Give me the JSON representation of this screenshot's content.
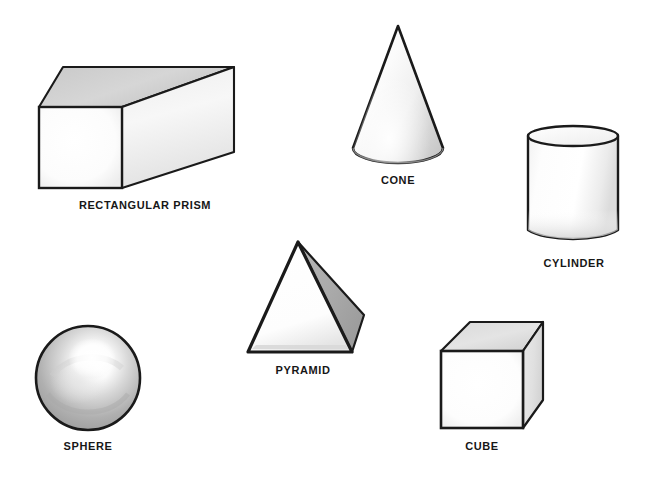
{
  "page": {
    "background_color": "#ffffff",
    "width": 653,
    "height": 479
  },
  "style": {
    "outline_color": "#1a1a1a",
    "fill_light": "#ffffff",
    "fill_shade_light": "#e8e8e8",
    "fill_shade_mid": "#c9c9c9",
    "fill_shade_dark": "#9a9a9a",
    "label_color": "#171717"
  },
  "shapes": [
    {
      "id": "rectangular-prism",
      "label": "RECTANGULAR PRISM",
      "label_x": 145,
      "label_y": 199,
      "faces": [
        "front-square",
        "top-face",
        "right-face"
      ]
    },
    {
      "id": "cone",
      "label": "CONE",
      "label_x": 398,
      "label_y": 174,
      "faces": [
        "lateral-surface",
        "base-ellipse"
      ]
    },
    {
      "id": "cylinder",
      "label": "CYLINDER",
      "label_x": 574,
      "label_y": 257,
      "faces": [
        "top-ellipse",
        "lateral-surface"
      ]
    },
    {
      "id": "pyramid",
      "label": "PYRAMID",
      "label_x": 303,
      "label_y": 364,
      "faces": [
        "front-triangle",
        "right-triangle"
      ]
    },
    {
      "id": "sphere",
      "label": "SPHERE",
      "label_x": 88,
      "label_y": 440,
      "faces": [
        "shaded-circle",
        "highlight"
      ]
    },
    {
      "id": "cube",
      "label": "CUBE",
      "label_x": 482,
      "label_y": 440,
      "faces": [
        "front-square",
        "top-face",
        "right-face"
      ]
    }
  ]
}
